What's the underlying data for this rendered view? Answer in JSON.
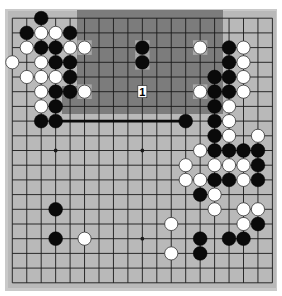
{
  "board": {
    "size": 19,
    "colors": {
      "board": "#b9b9b9",
      "frame": "#c9c9c9",
      "shade": "#7c7c7c",
      "highlight": "#a9a9a9",
      "line": "#1a1a1a",
      "black": "#0a0a0a",
      "white": "#ffffff"
    },
    "star_points": [
      [
        3,
        3
      ],
      [
        9,
        3
      ],
      [
        15,
        3
      ],
      [
        3,
        9
      ],
      [
        9,
        9
      ],
      [
        15,
        9
      ],
      [
        3,
        15
      ],
      [
        9,
        15
      ],
      [
        15,
        15
      ]
    ],
    "black_stones": [
      [
        2,
        0
      ],
      [
        1,
        1
      ],
      [
        4,
        1
      ],
      [
        2,
        2
      ],
      [
        3,
        2
      ],
      [
        9,
        2
      ],
      [
        15,
        2
      ],
      [
        3,
        3
      ],
      [
        4,
        3
      ],
      [
        9,
        3
      ],
      [
        15,
        3
      ],
      [
        4,
        4
      ],
      [
        14,
        4
      ],
      [
        15,
        4
      ],
      [
        3,
        5
      ],
      [
        4,
        5
      ],
      [
        14,
        5
      ],
      [
        15,
        5
      ],
      [
        3,
        6
      ],
      [
        14,
        6
      ],
      [
        2,
        7
      ],
      [
        3,
        7
      ],
      [
        12,
        7
      ],
      [
        14,
        7
      ],
      [
        14,
        8
      ],
      [
        14,
        9
      ],
      [
        15,
        9
      ],
      [
        16,
        9
      ],
      [
        17,
        9
      ],
      [
        17,
        10
      ],
      [
        14,
        11
      ],
      [
        15,
        11
      ],
      [
        17,
        11
      ],
      [
        13,
        12
      ],
      [
        3,
        13
      ],
      [
        17,
        14
      ],
      [
        3,
        15
      ],
      [
        13,
        15
      ],
      [
        15,
        15
      ],
      [
        16,
        15
      ],
      [
        13,
        16
      ]
    ],
    "white_stones": [
      [
        2,
        1
      ],
      [
        3,
        1
      ],
      [
        1,
        2
      ],
      [
        4,
        2
      ],
      [
        5,
        2
      ],
      [
        13,
        2
      ],
      [
        16,
        2
      ],
      [
        0,
        3
      ],
      [
        2,
        3
      ],
      [
        16,
        3
      ],
      [
        1,
        4
      ],
      [
        2,
        4
      ],
      [
        3,
        4
      ],
      [
        16,
        4
      ],
      [
        2,
        5
      ],
      [
        5,
        5
      ],
      [
        13,
        5
      ],
      [
        16,
        5
      ],
      [
        2,
        6
      ],
      [
        15,
        6
      ],
      [
        15,
        7
      ],
      [
        15,
        8
      ],
      [
        17,
        8
      ],
      [
        13,
        9
      ],
      [
        12,
        10
      ],
      [
        14,
        10
      ],
      [
        15,
        10
      ],
      [
        16,
        10
      ],
      [
        12,
        11
      ],
      [
        13,
        11
      ],
      [
        16,
        11
      ],
      [
        14,
        12
      ],
      [
        14,
        13
      ],
      [
        16,
        13
      ],
      [
        17,
        13
      ],
      [
        11,
        14
      ],
      [
        16,
        14
      ],
      [
        5,
        15
      ],
      [
        11,
        16
      ]
    ],
    "highlighted_points": [
      [
        5,
        2
      ],
      [
        9,
        2
      ],
      [
        9,
        3
      ],
      [
        13,
        2
      ],
      [
        5,
        5
      ],
      [
        13,
        5
      ]
    ],
    "label_markers": [
      {
        "point": [
          9,
          5
        ],
        "text": "1"
      }
    ],
    "line_marker": {
      "from": [
        3,
        7
      ],
      "to": [
        12,
        7
      ]
    }
  }
}
